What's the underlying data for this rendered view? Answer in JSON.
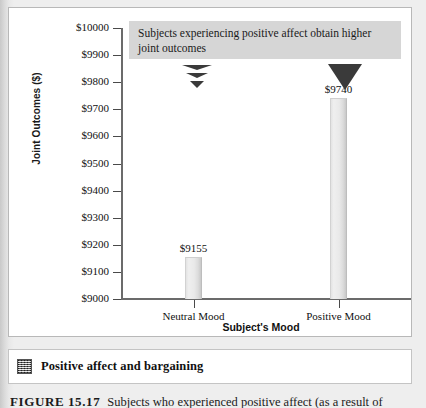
{
  "caption": {
    "icon_name": "halftone-thumbnail-icon",
    "title": "Positive affect and bargaining"
  },
  "figure_note": {
    "label": "FIGURE 15.17",
    "text": "Subjects who experienced positive affect (as a result of"
  },
  "callout": {
    "text": "Subjects experiencing positive affect obtain higher joint outcomes"
  },
  "markers": {
    "neutral_pointer_name": "stacked-triangle-pointer",
    "positive_pointer_name": "solid-triangle-pointer"
  },
  "chart_data": {
    "type": "bar",
    "title": "",
    "xlabel": "Subject's Mood",
    "ylabel": "Joint Outcomes ($)",
    "categories": [
      "Neutral Mood",
      "Positive Mood"
    ],
    "values": [
      9155,
      9740
    ],
    "value_labels": [
      "$9155",
      "$9740"
    ],
    "ylim": [
      9000,
      10000
    ],
    "ytick_values": [
      10000,
      9900,
      9800,
      9700,
      9600,
      9500,
      9400,
      9300,
      9200,
      9100,
      9000
    ],
    "ytick_labels": [
      "$10000",
      "$9900",
      "$9800",
      "$9700",
      "$9600",
      "$9500",
      "$9400",
      "$9300",
      "$9200",
      "$9100",
      "$9000"
    ],
    "grid": false,
    "legend": false
  }
}
